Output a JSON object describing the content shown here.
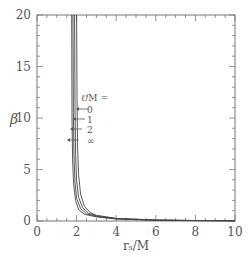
{
  "chart_data": {
    "type": "line",
    "title": "",
    "xlabel": "r_s/M",
    "ylabel": "β",
    "xlim": [
      0,
      10
    ],
    "ylim": [
      0,
      20
    ],
    "x_ticks": [
      "0",
      "2",
      "4",
      "6",
      "8",
      "10"
    ],
    "y_ticks": [
      "0",
      "5",
      "10",
      "15",
      "20"
    ],
    "grid": false,
    "legend": {
      "title": "ℓ̃/M =",
      "position": "inside, center-left next to curves",
      "entries": [
        "0",
        "1",
        "2",
        "∞"
      ]
    },
    "series": [
      {
        "name": "0",
        "x": [
          2.0,
          2.02,
          2.05,
          2.1,
          2.2,
          2.4,
          2.7,
          3.0,
          4.0,
          6.0,
          8.0,
          10.0
        ],
        "y": [
          20,
          12,
          7,
          4.5,
          2.6,
          1.4,
          0.8,
          0.55,
          0.25,
          0.1,
          0.05,
          0.03
        ]
      },
      {
        "name": "1",
        "x": [
          1.9,
          1.92,
          1.95,
          2.0,
          2.1,
          2.3,
          2.6,
          3.0,
          4.0,
          6.0,
          8.0,
          10.0
        ],
        "y": [
          20,
          11,
          6.5,
          4.0,
          2.3,
          1.3,
          0.75,
          0.5,
          0.23,
          0.09,
          0.05,
          0.03
        ]
      },
      {
        "name": "2",
        "x": [
          1.82,
          1.84,
          1.87,
          1.92,
          2.0,
          2.2,
          2.5,
          3.0,
          4.0,
          6.0,
          8.0,
          10.0
        ],
        "y": [
          20,
          10.5,
          6.2,
          3.8,
          2.2,
          1.2,
          0.7,
          0.45,
          0.21,
          0.08,
          0.04,
          0.02
        ]
      },
      {
        "name": "∞",
        "x": [
          1.75,
          1.77,
          1.8,
          1.85,
          1.95,
          2.1,
          2.4,
          3.0,
          4.0,
          6.0,
          8.0,
          10.0
        ],
        "y": [
          20,
          10,
          6,
          3.6,
          2.0,
          1.1,
          0.65,
          0.4,
          0.19,
          0.07,
          0.04,
          0.02
        ]
      }
    ]
  }
}
